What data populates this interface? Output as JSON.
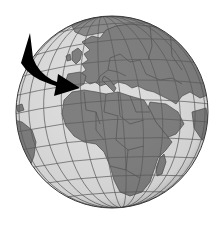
{
  "image": {
    "subject": "Globe showing Europe, Africa and the Middle East with a curved arrow pointing toward North Africa / Europe",
    "colors": {
      "background": "#ffffff",
      "ocean": "#dcdcdc",
      "land": "#7e7e7e",
      "land_border": "#4a4a4a",
      "graticule": "#5a5a5a",
      "rim": "#3a3a3a",
      "arrow": "#000000"
    },
    "globe": {
      "cx": 112,
      "cy": 112,
      "r": 96
    },
    "elements": [
      "globe",
      "graticule",
      "europe",
      "africa",
      "middle-east",
      "south-america-edge",
      "madagascar",
      "arrow"
    ]
  }
}
